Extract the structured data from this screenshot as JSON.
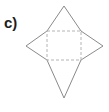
{
  "figure": {
    "label": "c)",
    "kind": "geometry-net-diagram",
    "colors": {
      "background": "#ffffff",
      "label_text": "#1d1d1d",
      "outline_stroke": "#8a8a8a",
      "fold_line_stroke": "#b4b4b4"
    },
    "shapes": {
      "star_outline": {
        "name": "four-pointed-star-outline",
        "stroke_style": "solid",
        "stroke_width": 1,
        "points": "64,6 81,31 103,46 81,60 64,98 47,60 26,46 47,31"
      },
      "fold_square": {
        "name": "inner-fold-square",
        "stroke_style": "dashed",
        "stroke_width": 1,
        "dash_pattern": "3,2",
        "x": 47,
        "y": 31,
        "width": 34,
        "height": 29
      },
      "star_tips": [
        {
          "name": "top-tip",
          "x": 64,
          "y": 6
        },
        {
          "name": "right-tip",
          "x": 103,
          "y": 46
        },
        {
          "name": "bottom-tip",
          "x": 64,
          "y": 98
        },
        {
          "name": "left-tip",
          "x": 26,
          "y": 46
        }
      ]
    }
  }
}
